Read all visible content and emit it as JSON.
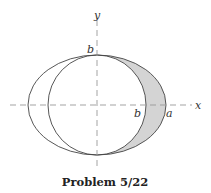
{
  "figure": {
    "caption": "Problem 5/22",
    "labels": {
      "y_axis": "y",
      "x_axis": "x",
      "top_b": "b",
      "right_b": "b",
      "right_a": "a"
    },
    "shapes": {
      "ellipse": {
        "semi_major": "a",
        "semi_minor": "b"
      },
      "circle": {
        "radius": "b"
      },
      "shaded_region": "area between ellipse and circle, x > 0"
    },
    "colors": {
      "stroke": "#444444",
      "axis": "#999999",
      "shade": "#d4d4d4"
    }
  }
}
